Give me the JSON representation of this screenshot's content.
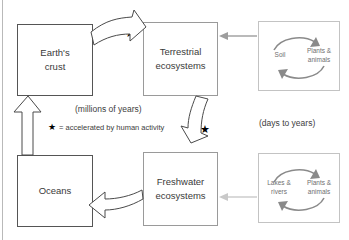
{
  "figure": {
    "clipped_top_text": "",
    "boxes": [
      {
        "id": "earth-crust",
        "line1": "Earth's",
        "line2": "crust"
      },
      {
        "id": "terrestrial-ecosystems",
        "line1": "Terrestrial",
        "line2": "ecosystems"
      },
      {
        "id": "oceans",
        "line1": "Oceans",
        "line2": ""
      },
      {
        "id": "freshwater-ecosystems",
        "line1": "Freshwater",
        "line2": "ecosystems"
      }
    ],
    "mini_panels": [
      {
        "id": "terrestrial-cycle",
        "left_label_line1": "Soil",
        "left_label_line2": "",
        "right_label_line1": "Plants &",
        "right_label_line2": "animals"
      },
      {
        "id": "freshwater-cycle",
        "left_label_line1": "Lakes &",
        "left_label_line2": "rivers",
        "right_label_line1": "Plants &",
        "right_label_line2": "animals"
      }
    ],
    "captions": {
      "millions": "(millions of years)",
      "days": "(days to years)"
    },
    "legend": {
      "star_glyph": "★",
      "text": "= accelerated by human activity"
    },
    "star_markers": {
      "top": "★",
      "middle": "★"
    },
    "colors": {
      "box_border": "#9a9a9a",
      "mini_border": "#c3c3c3",
      "arrow_stroke": "#4a4a4a",
      "cycle_arrow": "#8a8a8a",
      "thin_arrow": "#9d9d9d",
      "text": "#3a3a3a"
    }
  }
}
